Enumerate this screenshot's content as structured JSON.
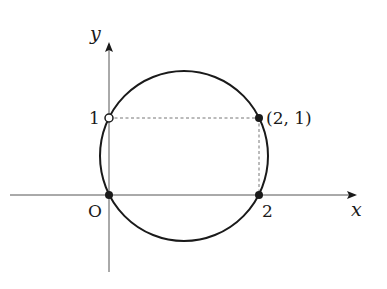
{
  "diagram": {
    "axes": {
      "x_label": "x",
      "y_label": "y",
      "origin_label": "O"
    },
    "ticks": {
      "x_tick": "2",
      "y_tick": "1"
    },
    "points": [
      {
        "name": "origin",
        "coords": "(0, 0)",
        "style": "filled"
      },
      {
        "name": "x-intercept",
        "coords": "(2, 0)",
        "style": "filled"
      },
      {
        "name": "y-intercept",
        "coords": "(0, 1)",
        "style": "open"
      },
      {
        "name": "corner",
        "label": "(2, 1)",
        "style": "filled"
      }
    ],
    "curve": "circle through (0,0), (2,0), (0,1), (2,1)",
    "colors": {
      "stroke": "#1a1a1a",
      "axis": "#555555",
      "dashed": "#666666"
    }
  }
}
